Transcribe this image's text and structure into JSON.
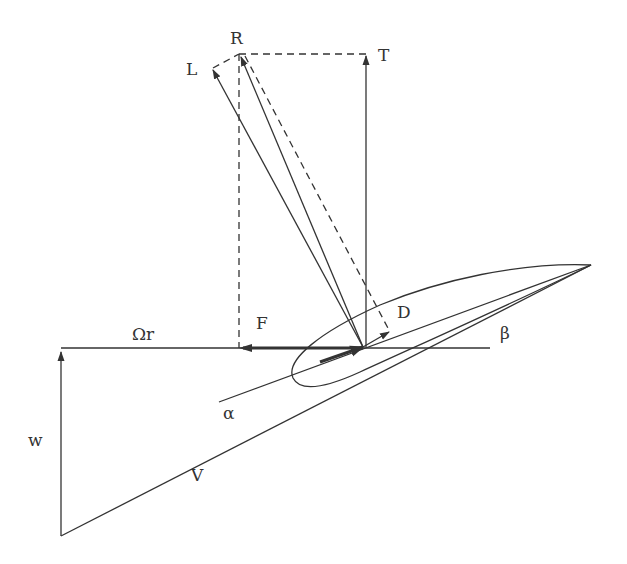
{
  "diagram": {
    "type": "blade-element force and velocity diagram",
    "colors": {
      "line": "#333333",
      "background": "#ffffff"
    },
    "labels": {
      "resultant": "R",
      "lift": "L",
      "thrust": "T",
      "drag": "D",
      "force_tangential": "F",
      "rotational_speed": "Ωr",
      "pitch_angle": "β",
      "angle_of_attack": "α",
      "induced_velocity": "w",
      "relative_velocity": "V"
    }
  }
}
